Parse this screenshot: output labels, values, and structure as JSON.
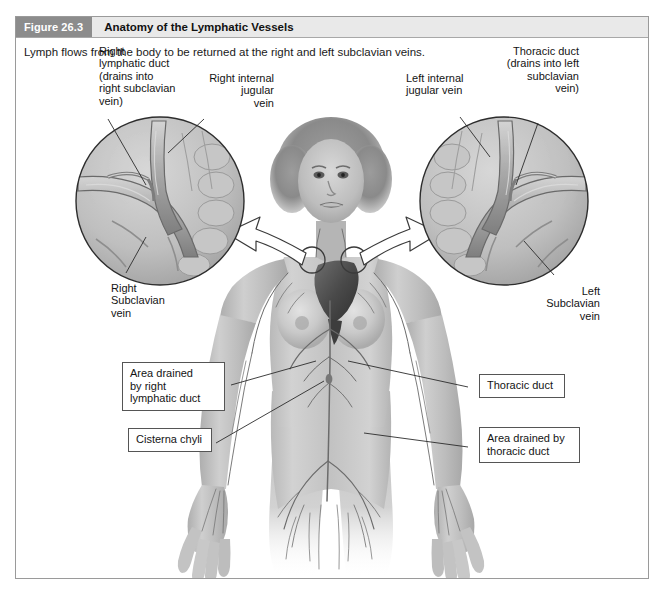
{
  "figure": {
    "number_label": "Figure 26.3",
    "title": "Anatomy of the Lymphatic Vessels",
    "caption": "Lymph flows from the body to be returned at the right and left subclavian veins.",
    "header_bg": "#e9e9e9",
    "number_tab_bg": "#8c8c8c",
    "frame_border": "#9a9a9a"
  },
  "labels": {
    "right_lymphatic_duct": "Right\nlymphatic duct\n(drains into\nright subclavian\nvein)",
    "right_internal_jugular_vein": "Right internal\njugular\nvein",
    "left_internal_jugular_vein": "Left internal\njugular vein",
    "thoracic_duct_drains": "Thoracic duct\n(drains into left\nsubclavian\nvein)",
    "right_subclavian_vein": "Right\nSubclavian\nvein",
    "left_subclavian_vein": "Left\nSubclavian\nvein"
  },
  "callouts": {
    "area_drained_right_lymphatic_duct": "Area drained\nby right\nlymphatic duct",
    "cisterna_chyli": "Cisterna chyli",
    "thoracic_duct": "Thoracic duct",
    "area_drained_thoracic_duct": "Area drained by\nthoracic duct"
  },
  "illustration": {
    "subject": "anterior view of female body showing lymphatic vessel network",
    "inset_left": "magnified view of right lymphatic duct entering right subclavian vein",
    "inset_right": "magnified view of thoracic duct entering left subclavian vein"
  }
}
